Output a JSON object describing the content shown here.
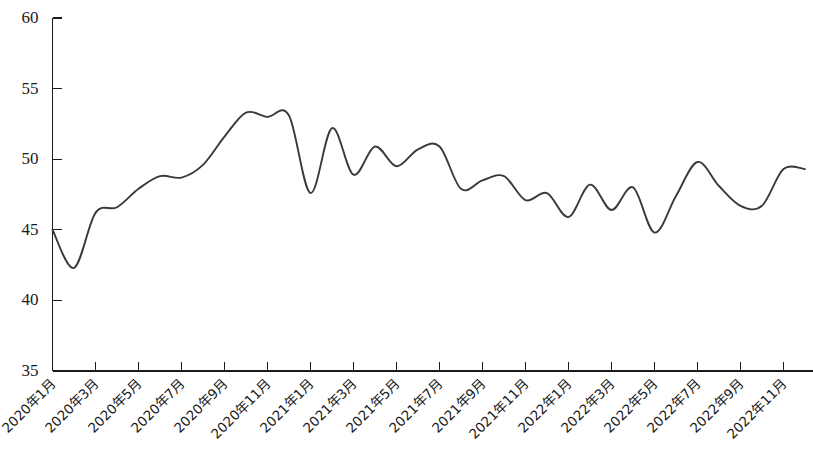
{
  "chart_data": {
    "type": "line",
    "title": "",
    "subtitle": "",
    "xlabel": "",
    "ylabel": "",
    "ylim": [
      35,
      60
    ],
    "ytick_values": [
      35,
      40,
      45,
      50,
      55,
      60
    ],
    "ytick_labels": [
      "35",
      "40",
      "45",
      "50",
      "55",
      "60"
    ],
    "grid": false,
    "legend": null,
    "legend_position": "none",
    "line_color": "#3a3a3a",
    "axis_color": "#1a1a1a",
    "background_color": "#ffffff",
    "x_tick_labels": [
      "2020年1月",
      "2020年3月",
      "2020年5月",
      "2020年7月",
      "2020年9月",
      "2020年11月",
      "2021年1月",
      "2021年3月",
      "2021年5月",
      "2021年7月",
      "2021年9月",
      "2021年11月",
      "2022年1月",
      "2022年3月",
      "2022年5月",
      "2022年7月",
      "2022年9月",
      "2022年11月"
    ],
    "x_tick_label_rotation_deg": -45,
    "x_tick_label_interval_months": 2,
    "categories": [
      "2020年1月",
      "2020年2月",
      "2020年3月",
      "2020年4月",
      "2020年5月",
      "2020年6月",
      "2020年7月",
      "2020年8月",
      "2020年9月",
      "2020年10月",
      "2020年11月",
      "2020年12月",
      "2021年1月",
      "2021年2月",
      "2021年3月",
      "2021年4月",
      "2021年5月",
      "2021年6月",
      "2021年7月",
      "2021年8月",
      "2021年9月",
      "2021年10月",
      "2021年11月",
      "2021年12月",
      "2022年1月",
      "2022年2月",
      "2022年3月",
      "2022年4月",
      "2022年5月",
      "2022年6月",
      "2022年7月",
      "2022年8月",
      "2022年9月",
      "2022年10月",
      "2022年11月",
      "2022年12月"
    ],
    "values": [
      45.0,
      42.3,
      46.2,
      46.6,
      47.9,
      48.8,
      48.7,
      49.6,
      51.6,
      53.3,
      53.0,
      53.1,
      47.6,
      52.2,
      48.9,
      50.9,
      49.5,
      50.7,
      50.9,
      47.9,
      48.5,
      48.8,
      47.1,
      47.6,
      45.9,
      48.2,
      46.4,
      48.0,
      44.8,
      47.4,
      49.8,
      48.1,
      46.7,
      46.7,
      49.3,
      49.3
    ],
    "value_range_observed": {
      "min": 42.3,
      "min_label": "2020年2月",
      "max": 53.3,
      "max_label": "2020年10月"
    },
    "series": [
      {
        "name": "",
        "values": [
          45.0,
          42.3,
          46.2,
          46.6,
          47.9,
          48.8,
          48.7,
          49.6,
          51.6,
          53.3,
          53.0,
          53.1,
          47.6,
          52.2,
          48.9,
          50.9,
          49.5,
          50.7,
          50.9,
          47.9,
          48.5,
          48.8,
          47.1,
          47.6,
          45.9,
          48.2,
          46.4,
          48.0,
          44.8,
          47.4,
          49.8,
          48.1,
          46.7,
          46.7,
          49.3,
          49.3
        ]
      }
    ]
  }
}
